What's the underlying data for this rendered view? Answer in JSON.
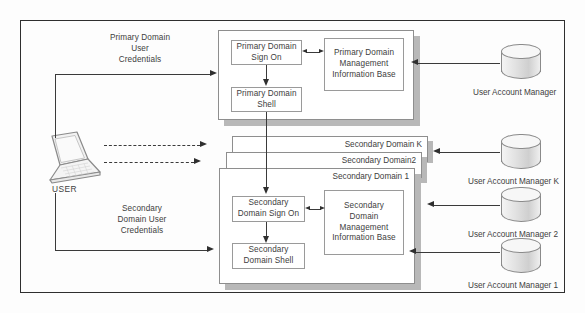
{
  "diagram": {
    "actor": {
      "label": "USER",
      "icon": "laptop-icon"
    },
    "flows": {
      "primary_credentials": "Primary Domain\nUser\nCredentials",
      "primary_credentials_lines": [
        "Primary Domain",
        "User",
        "Credentials"
      ],
      "secondary_credentials_lines": [
        "Secondary",
        "Domain User",
        "Credentials"
      ]
    },
    "primary_domain": {
      "sign_on": "Primary Domain\nSign On",
      "sign_on_lines": [
        "Primary Domain",
        "Sign On"
      ],
      "shell_lines": [
        "Primary Domain",
        "Shell"
      ],
      "mib_lines": [
        "Primary Domain",
        "Management",
        "Information Base"
      ]
    },
    "secondary_domains": {
      "stack_labels": [
        "Secondary Domain K",
        "Secondary Domain2",
        "Secondary Domain 1"
      ],
      "sign_on_lines": [
        "Secondary",
        "Domain Sign On"
      ],
      "shell_lines": [
        "Secondary",
        "Domain Shell"
      ],
      "mib_lines": [
        "Secondary",
        "Domain",
        "Management",
        "Information Base"
      ]
    },
    "account_managers": [
      {
        "label": "User Account Manager",
        "icon": "database-cylinder-icon"
      },
      {
        "label": "User Account Manager K",
        "icon": "database-cylinder-icon"
      },
      {
        "label": "User Account Manager 2",
        "icon": "database-cylinder-icon"
      },
      {
        "label": "User Account Manager 1",
        "icon": "database-cylinder-icon"
      }
    ],
    "colors": {
      "line": "#3a3a3a",
      "frame": "#2f2f2f",
      "box_border": "#9a9a9a",
      "shadow": "#b8b8b8",
      "text": "#404040",
      "background": "#fdfdfd"
    }
  }
}
